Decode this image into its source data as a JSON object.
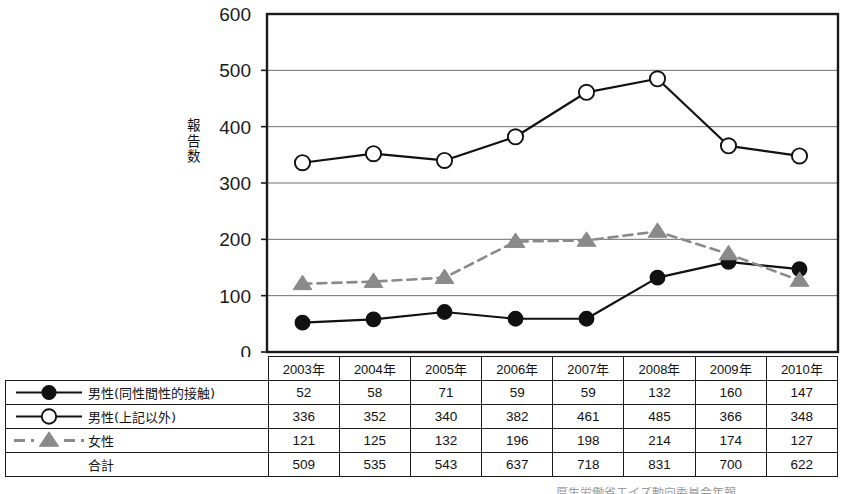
{
  "chart_data": {
    "type": "line",
    "title": "",
    "xlabel": "",
    "ylabel": "報告数",
    "ylim": [
      0,
      600
    ],
    "yticks": [
      0,
      100,
      200,
      300,
      400,
      500,
      600
    ],
    "grid": true,
    "legend_position": "table-left-column",
    "categories": [
      "2003年",
      "2004年",
      "2005年",
      "2006年",
      "2007年",
      "2008年",
      "2009年",
      "2010年"
    ],
    "series": [
      {
        "name": "男性(同性間性的接触)",
        "values": [
          52,
          58,
          71,
          59,
          59,
          132,
          160,
          147
        ],
        "marker": "filled-circle",
        "line": "solid",
        "color": "#111111",
        "plotted": true
      },
      {
        "name": "男性(上記以外)",
        "values": [
          336,
          352,
          340,
          382,
          461,
          485,
          366,
          348
        ],
        "marker": "open-circle",
        "line": "solid",
        "color": "#111111",
        "plotted": true
      },
      {
        "name": "女性",
        "values": [
          121,
          125,
          132,
          196,
          198,
          214,
          174,
          127
        ],
        "marker": "filled-triangle",
        "line": "dashed",
        "color": "#8a8a8a",
        "plotted": true
      },
      {
        "name": "合計",
        "values": [
          509,
          535,
          543,
          637,
          718,
          831,
          700,
          622
        ],
        "marker": "none",
        "line": "none",
        "color": "#111111",
        "plotted": false
      }
    ]
  },
  "table": {
    "corner_label": "",
    "column_headers": [
      "2003年",
      "2004年",
      "2005年",
      "2006年",
      "2007年",
      "2008年",
      "2009年",
      "2010年"
    ],
    "rows": [
      {
        "label": "男性(同性間性的接触)",
        "swatch": "line-filled-circle-icon",
        "values": [
          "52",
          "58",
          "71",
          "59",
          "59",
          "132",
          "160",
          "147"
        ]
      },
      {
        "label": "男性(上記以外)",
        "swatch": "line-open-circle-icon",
        "values": [
          "336",
          "352",
          "340",
          "382",
          "461",
          "485",
          "366",
          "348"
        ]
      },
      {
        "label": "女性",
        "swatch": "dashed-line-triangle-icon",
        "values": [
          "121",
          "125",
          "132",
          "196",
          "198",
          "214",
          "174",
          "127"
        ]
      },
      {
        "label": "合計",
        "swatch": "none",
        "values": [
          "509",
          "535",
          "543",
          "637",
          "718",
          "831",
          "700",
          "622"
        ]
      }
    ]
  },
  "axis": {
    "y_title": "報告数",
    "y_tick_labels": [
      "600",
      "500",
      "400",
      "300",
      "200",
      "100",
      "0"
    ]
  },
  "source_note": "厚生労働省エイズ動向委員会年報",
  "colors": {
    "axis": "#1a1a1a",
    "gridline": "#6e6e6e",
    "series_male_msm": "#111111",
    "series_male_other": "#111111",
    "series_female": "#8a8a8a",
    "table_border": "#1a1a1a",
    "background": "#ffffff"
  }
}
